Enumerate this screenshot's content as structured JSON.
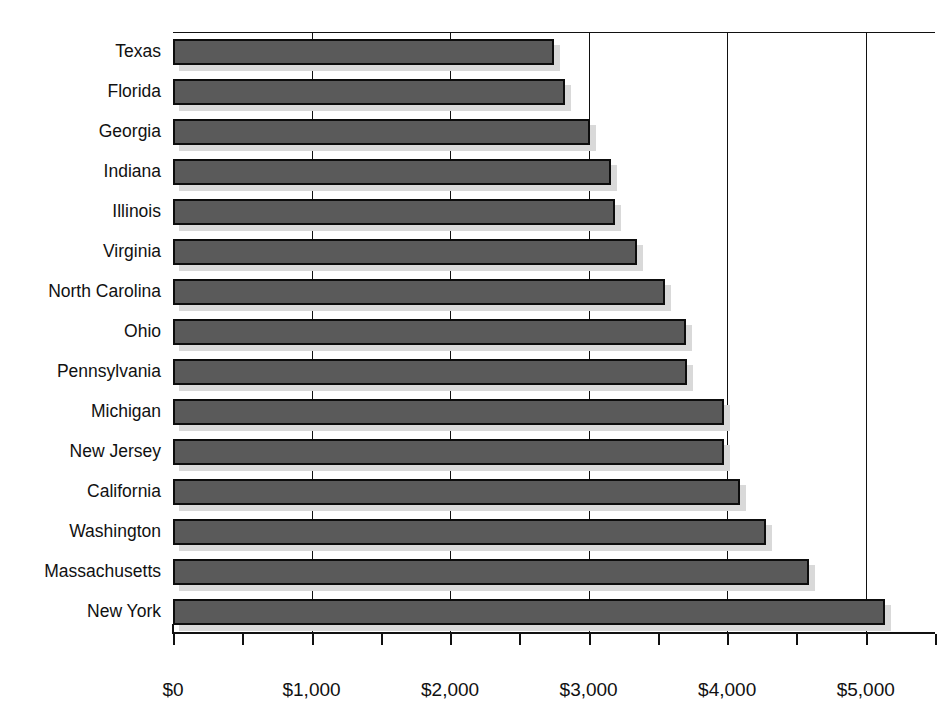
{
  "chart_data": {
    "type": "bar",
    "orientation": "horizontal",
    "title": "",
    "xlabel": "",
    "ylabel": "",
    "xlim": [
      0,
      5500
    ],
    "grid": true,
    "legend": null,
    "x_major_step": 1000,
    "x_minor_step": 500,
    "x_tick_labels": [
      "$0",
      "$1,000",
      "$2,000",
      "$3,000",
      "$4,000",
      "$5,000"
    ],
    "x_tick_values": [
      0,
      1000,
      2000,
      3000,
      4000,
      5000
    ],
    "x_minor_values": [
      500,
      1500,
      2500,
      3500,
      4500
    ],
    "categories": [
      "Texas",
      "Florida",
      "Georgia",
      "Indiana",
      "Illinois",
      "Virginia",
      "North Carolina",
      "Ohio",
      "Pennsylvania",
      "Michigan",
      "New Jersey",
      "California",
      "Washington",
      "Massachusetts",
      "New York"
    ],
    "values": [
      2750,
      2830,
      3010,
      3160,
      3190,
      3350,
      3550,
      3700,
      3710,
      3980,
      3980,
      4090,
      4280,
      4590,
      5140
    ],
    "bar_color": "#5a5a5a",
    "bar_border_color": "#0d0d0d",
    "shadow_color": "#d9d9d9",
    "axis_color": "#111111",
    "background_color": "#ffffff"
  }
}
